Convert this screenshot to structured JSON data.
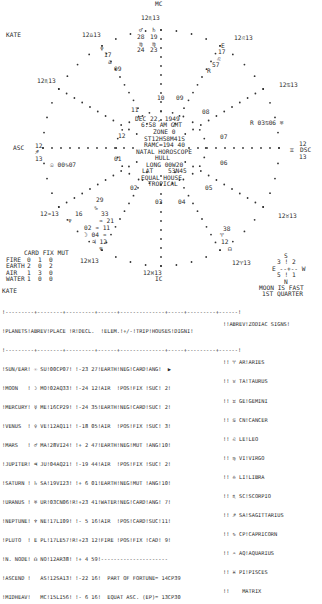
{
  "chart_labels": {
    "mc": "MC",
    "ic": "IC",
    "asc": "ASC",
    "dsc": "DSC",
    "name_top": "KATE",
    "name_table": "KATE",
    "cusps": {
      "mc": "12♏13",
      "ic": "12♉13",
      "asc": [
        "12",
        "♐",
        "13"
      ],
      "dsc": [
        "12",
        "♊",
        "13"
      ],
      "c11": "12♎13",
      "c12": "12♏13",
      "c9": "12♌13",
      "c8": "12♋13",
      "c2": "12♒13",
      "c3": "12♓13",
      "c5": "12♈13",
      "c6": "12♉13",
      "c4": "12♓13",
      "ic_cusp": "12♓13"
    },
    "houses": [
      "01",
      "02",
      "03",
      "04",
      "05",
      "06",
      "07",
      "08",
      "09",
      "10",
      "11",
      "12"
    ]
  },
  "center_info": {
    "date": "DEC 22, 1949",
    "time": "6:58 AM GMT",
    "zone": "ZONE 0",
    "sidereal": "ST12H58M41S",
    "ramc": "RAMC=194 40",
    "type": "NATAL HOROSCOPE",
    "place": "HULL",
    "long": "LONG 00W20",
    "lat": "LAT    53N45",
    "house_system": "EQUAL HOUSE",
    "zodiac": "TROPICAL"
  },
  "planet_glyphs": {
    "top_mars": {
      "glyph": "♂",
      "deg": "28",
      "sign": "♍",
      "min": "24"
    },
    "top_saturn": {
      "glyph": "♄",
      "deg": "19",
      "sign": "♍",
      "min": "23"
    },
    "neptune_top": {
      "glyph": "♆",
      "deg": "17",
      "sign": "♎",
      "min": "09"
    },
    "pluto": {
      "glyph": "E",
      "deg": "17",
      "sign": "♌",
      "min": "57"
    },
    "pluto_r": "R",
    "uranus": "R 03♋06 ♅",
    "sun": "☉ 00♑07",
    "venus": {
      "deg": "29",
      "sign": "♑"
    },
    "mercury": {
      "deg": "16",
      "sign": "♑",
      "min": "33"
    },
    "jupiter_etc": [
      "♆",
      "♒ 21",
      "02 ♒ 11",
      "☽ 04 ♒",
      "♃ 12",
      "♆"
    ],
    "node": {
      "deg": "38",
      "sign": "♈",
      "min": "12",
      "glyph": "☊"
    }
  },
  "elements_table": {
    "headers": [
      "CARD",
      "FIX",
      "MUT"
    ],
    "rows": [
      {
        "label": "FIRE",
        "values": [
          "0",
          "1",
          "0"
        ]
      },
      {
        "label": "EARTH",
        "values": [
          "2",
          "0",
          "2"
        ]
      },
      {
        "label": "AIR",
        "values": [
          "1",
          "3",
          "0"
        ]
      },
      {
        "label": "WATER",
        "values": [
          "1",
          "0",
          "0"
        ]
      }
    ]
  },
  "moon_phase": {
    "compass": [
      "S",
      "3 ! 2",
      "E --+-- W",
      "5 ! 1",
      "N"
    ],
    "line1": "MOON IS FAST",
    "line2": "1ST QUARTER"
  },
  "planet_table": {
    "separator": "!---------+--------+---------+------+--------------+-----+---------+------!",
    "header": "!PLANETS!ABREV!PLACE !R!DECL.  !ELEM.!+/-!TRIP!HOUSES!DIGNI!",
    "rows": [
      "!SUN/EAR! ☉ SU!00CP07! !-23 27!EARTH!NEG!CARD!ANG!  ▶ ",
      "!MOON   ! ☽ MO!02AQ33! !-24 12!AIR  !POS!FIX !SUC! 2!",
      "!MERCURY! ☿ ME!16CP29! !-24 35!EARTH!NEG!CARD!SUC! 2!",
      "!VENUS  ! ♀ VE!12AQ11! !-18 05!AIR  !POS!FIX !SUC! 3!",
      "!MARS   ! ♂ MA!28VI24! !+ 2 47!EARTH!NEG!MUT !ANG!10!",
      "!JUPITER! ♃ JU!04AQ21! !-19 44!AIR  !POS!FIX !SUC! 2!",
      "!SATURN ! ♄ SA!19VI23! !+ 6 01!EARTH!NEG!MUT !ANG!10!",
      "!URANUS ! ♅ UR!03CN06!R!+23 41!WATER!NEG!CARD!ANG! 7!",
      "!NEPTUNE! ♆ NE!17LI09! !- 5 16!AIR  !POS!CARD!SUC!11!",
      "!PLUTO  ! E PL!17LE57!R!+23 12!FIRE !POS!FIX !CAD! 9!",
      "!N. NODE! ☊ NO!12AR38! !+ 4 59!---------------------",
      "!ASCEND !   AS!12SA13! !-22 16!  PART OF FORTUNE= 14CP39",
      "!MIDHEAV!   MC!15LI56! !- 6 16!  EQUAT ASC. (EP)= 13CP30"
    ]
  },
  "zodiac_table": {
    "header": "!!ABREV!ZODIAC SIGNS!",
    "rows": [
      "!! ♈ AR!ARIES",
      "!! ♉ TA!TAURUS",
      "!! ♊ GE!GEMINI",
      "!! ♋ CN!CANCER",
      "!! ♌ LE!LEO",
      "!! ♍ VI!VIRGO",
      "!! ♎ LI!LIBRA",
      "!! ♏ SC!SCORPIO",
      "!! ♐ SA!SAGITTARIUS",
      "!! ♑ CP!CAPRICORN",
      "!! ♒ AQ!AQUARIUS",
      "!! ♓ PI!PISCES",
      "!!    MATRIX"
    ]
  }
}
